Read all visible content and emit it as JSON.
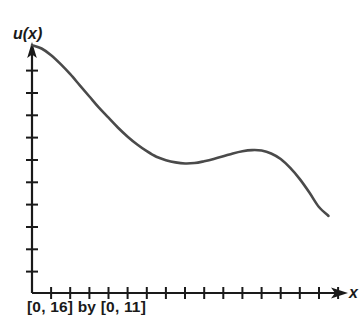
{
  "figure": {
    "background_color": "#ffffff",
    "axis_color": "#1a1a1a",
    "curve_color": "#4a4a4a",
    "ylabel_text": "u(x)",
    "xlabel_text": "x",
    "window_caption": "[0, 16] by [0, 11]"
  },
  "chart_data": {
    "type": "line",
    "title": "",
    "subtitle": "",
    "xlabel": "x",
    "ylabel": "u(x)",
    "annotations": [
      "[0, 16] by [0, 11]"
    ],
    "legend": [],
    "legend_position": "none",
    "grid": false,
    "axis_arrows": true,
    "xlim": [
      0,
      16
    ],
    "ylim": [
      0,
      11
    ],
    "x_tick_count": 16,
    "y_tick_count": 10,
    "x_tick_values": [
      1,
      2,
      3,
      4,
      5,
      6,
      7,
      8,
      9,
      10,
      11,
      12,
      13,
      14,
      15,
      16
    ],
    "y_tick_values": [
      1,
      2,
      3,
      4,
      5,
      6,
      7,
      8,
      9,
      10
    ],
    "x_tick_labels": [],
    "y_tick_labels": [],
    "series": [
      {
        "name": "u(x)",
        "color": "#4a4a4a",
        "x": [
          0.0,
          0.5,
          1.0,
          1.5,
          2.0,
          2.5,
          3.0,
          3.5,
          4.0,
          4.5,
          5.0,
          5.5,
          6.0,
          6.5,
          7.0,
          7.5,
          8.0,
          8.5,
          9.0,
          9.5,
          10.0,
          10.5,
          11.0,
          11.5,
          12.0,
          12.5,
          13.0,
          13.5,
          14.0,
          14.5,
          15.0,
          15.5
        ],
        "y": [
          11.1,
          10.95,
          10.65,
          10.25,
          9.8,
          9.3,
          8.8,
          8.3,
          7.85,
          7.4,
          7.0,
          6.65,
          6.35,
          6.1,
          5.95,
          5.85,
          5.8,
          5.82,
          5.9,
          6.0,
          6.12,
          6.25,
          6.35,
          6.4,
          6.38,
          6.25,
          6.0,
          5.6,
          5.1,
          4.5,
          3.85,
          3.45
        ]
      }
    ]
  }
}
